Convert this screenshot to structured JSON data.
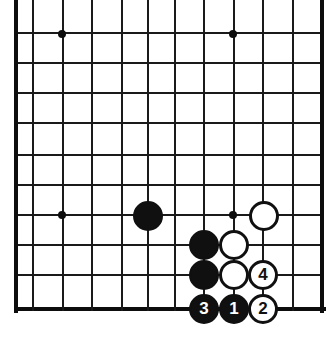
{
  "figure": {
    "board_type": "go-board",
    "width": 332,
    "height": 356,
    "background_color": "#ffffff",
    "line_color": "#1a1a1a",
    "border_color": "#0d0d0d"
  },
  "board": {
    "grid": {
      "vertical_x": [
        16,
        33,
        63,
        92,
        122,
        148,
        175,
        204,
        234,
        263,
        293,
        322
      ],
      "horizontal_y": [
        33,
        63,
        93,
        123,
        155,
        185,
        215,
        245,
        275,
        309
      ],
      "left_border_x": 16,
      "right_border_x": 322,
      "bottom_border_y": 309,
      "top_open": true,
      "spacing": 29.5
    },
    "star_points": [
      {
        "name": "star-point-upper-left",
        "x": 62,
        "y": 34
      },
      {
        "name": "star-point-upper-right",
        "x": 233,
        "y": 34
      },
      {
        "name": "star-point-left-middle",
        "x": 62,
        "y": 215
      },
      {
        "name": "star-point-right-middle",
        "x": 233,
        "y": 215
      }
    ]
  },
  "stones": [
    {
      "id": "black-approach-stone",
      "color": "black",
      "label": "",
      "x": 148,
      "y": 216
    },
    {
      "id": "white-corner-stone",
      "color": "white",
      "label": "",
      "x": 264,
      "y": 216
    },
    {
      "id": "black-wall-upper",
      "color": "black",
      "label": "",
      "x": 204,
      "y": 245
    },
    {
      "id": "white-wall-upper",
      "color": "white",
      "label": "",
      "x": 234,
      "y": 245
    },
    {
      "id": "black-wall-lower",
      "color": "black",
      "label": "",
      "x": 204,
      "y": 275
    },
    {
      "id": "white-wall-lower",
      "color": "white",
      "label": "",
      "x": 234,
      "y": 275
    },
    {
      "id": "white-move-4",
      "color": "white",
      "label": "4",
      "x": 263,
      "y": 275
    },
    {
      "id": "black-move-3",
      "color": "black",
      "label": "3",
      "x": 204,
      "y": 309
    },
    {
      "id": "black-move-1",
      "color": "black",
      "label": "1",
      "x": 234,
      "y": 309
    },
    {
      "id": "white-move-2",
      "color": "white",
      "label": "2",
      "x": 263,
      "y": 309
    }
  ],
  "move_sequence": [
    {
      "number": "1",
      "color": "black"
    },
    {
      "number": "2",
      "color": "white"
    },
    {
      "number": "3",
      "color": "black"
    },
    {
      "number": "4",
      "color": "white"
    }
  ],
  "colors": {
    "black_stone": "#101010",
    "white_stone": "#ffffff",
    "stone_outline": "#101010",
    "grid_line": "#1a1a1a",
    "board_background": "#ffffff"
  }
}
